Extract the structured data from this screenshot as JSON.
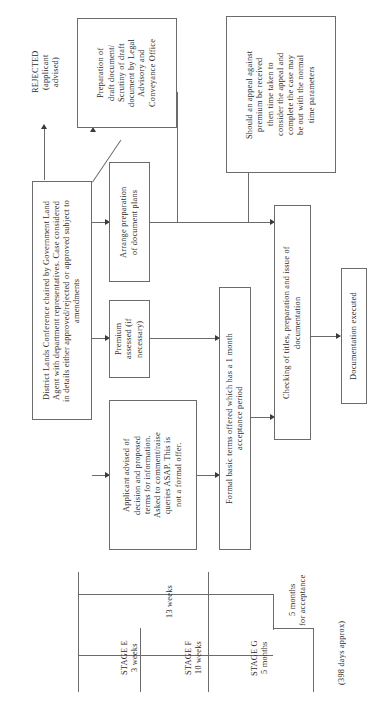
{
  "diagram": {
    "orientation": "rotated-90-ccw",
    "nodes": [
      {
        "id": "conference",
        "label": "District Lands Conference chaired by Government Land\nAgent with department representatives. Case considered\nin details either approved/rejected or approved subject to\namendments"
      },
      {
        "id": "rejected",
        "label": "REJECTED\n(applicant\nadvised)"
      },
      {
        "id": "draft-doc",
        "label": "Preparation of\ndraft document/\nScrutiny of draft\ndocument by Legal\nAdvisory and\nConveyance Office"
      },
      {
        "id": "appeal-note",
        "label": "Should an appeal against\npremium be received\nthen time taken to\nconsider the appeal and\ncomplete the case may\nbe out with the normal\ntime parameters"
      },
      {
        "id": "doc-plans",
        "label": "Arrange preparation\nof document plans"
      },
      {
        "id": "premium",
        "label": "Premium\nassessed (if\nnecessary)"
      },
      {
        "id": "applicant-advised",
        "label": "Applicant advised of\ndecision and proposed\nterms for information.\nAsked to comment/raise\nqueries ASAP. This is\nnot a formal offer."
      },
      {
        "id": "formal-terms",
        "label": "Formal basic terms offered which has a 1 month\nacceptance period"
      },
      {
        "id": "checking-titles",
        "label": "Checking of titles, preparation and issue of\ndocumentation"
      },
      {
        "id": "doc-executed",
        "label": "Documentation executed"
      }
    ],
    "timeline": {
      "stages": [
        {
          "id": "stage-e",
          "label": "STAGE E\n3 weeks"
        },
        {
          "id": "stage-f",
          "label": "STAGE F\n10 weeks"
        },
        {
          "id": "stage-g",
          "label": "STAGE G\n5 months"
        }
      ],
      "spans": [
        {
          "id": "span-13-weeks",
          "label": "13 weeks"
        },
        {
          "id": "span-5-months-acceptance",
          "label": "5 months\nfor acceptance"
        }
      ],
      "total": {
        "id": "total-days",
        "label": "(398 days approx)"
      }
    }
  },
  "colors": {
    "box_border": "#6b6b6b",
    "line": "#6b6b6b",
    "arrow": "#3a3a3a",
    "text": "#2b2b2b",
    "background": "#ffffff"
  }
}
